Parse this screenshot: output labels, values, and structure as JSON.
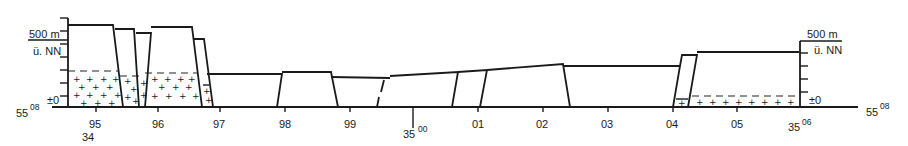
{
  "diagram": {
    "type": "geological-cross-section",
    "left_axis": {
      "elevation_top_label": "500 m",
      "datum_label": "ü. NN",
      "zero_label": "±0",
      "northing_main": "55",
      "northing_sup": "08"
    },
    "right_axis": {
      "elevation_top_label": "500 m",
      "datum_label": "ü. NN",
      "zero_label": "±0",
      "northing_main": "55",
      "northing_sup": "08"
    },
    "x_axis": {
      "ticks": [
        "95",
        "96",
        "97",
        "98",
        "99",
        "00",
        "01",
        "02",
        "03",
        "04",
        "05",
        "06"
      ],
      "start_prefix": "34",
      "mid_prefix": "35",
      "mid_sup": "00",
      "end_prefix": "35",
      "end_sup": "06"
    },
    "legend": {
      "crystalline_basement_symbol": "+",
      "boundary_line_style": "dashed"
    }
  }
}
